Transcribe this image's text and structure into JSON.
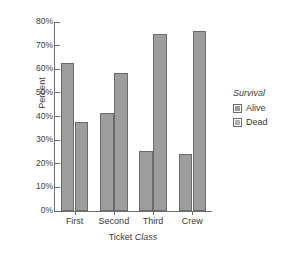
{
  "chart_data": {
    "type": "bar",
    "title": "",
    "categories": [
      "First",
      "Second",
      "Third",
      "Crew"
    ],
    "series": [
      {
        "name": "Alive",
        "values": [
          62.5,
          41.4,
          25.2,
          24.0
        ],
        "color": "#9d9d9d"
      },
      {
        "name": "Dead",
        "values": [
          37.5,
          58.6,
          74.8,
          76.0
        ],
        "color": "#9d9d9d"
      }
    ],
    "xlabel_parts": {
      "plain": "Ticket ",
      "emphasis": "Class"
    },
    "xlabel": "Ticket Class",
    "ylabel": "Percent",
    "ylim": [
      0,
      80
    ],
    "yticks": [
      0,
      10,
      20,
      30,
      40,
      50,
      60,
      70,
      80
    ],
    "ytick_labels": [
      "0%",
      "10%",
      "20%",
      "30%",
      "40%",
      "50%",
      "60%",
      "70%",
      "80%"
    ],
    "grid": false,
    "legend": {
      "title": "Survival",
      "position": "right",
      "entries": [
        "Alive",
        "Dead"
      ]
    }
  }
}
